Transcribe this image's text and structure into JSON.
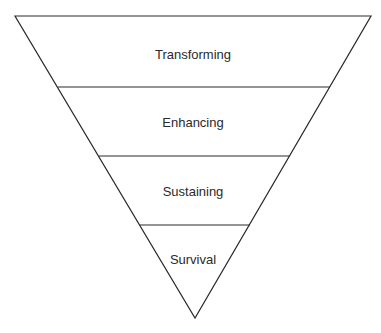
{
  "diagram": {
    "type": "inverted-pyramid",
    "line_color": "#2a2a2a",
    "levels": [
      {
        "label": "Transforming"
      },
      {
        "label": "Enhancing"
      },
      {
        "label": "Sustaining"
      },
      {
        "label": "Survival"
      }
    ]
  }
}
